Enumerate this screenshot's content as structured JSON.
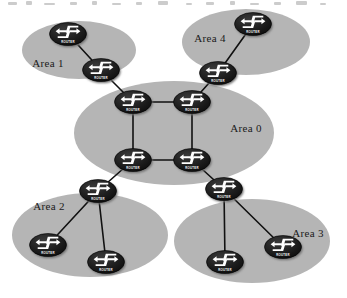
{
  "diagram": {
    "kind": "network-topology-diagram",
    "background_color": "#ffffff",
    "area_fill_color": "#b5b5b5",
    "router_body_color": "#1c1c1c",
    "router_glyph_color": "#ffffff",
    "link_color": "#111111",
    "label_color": "#1a1a1a",
    "router_icon_name": "router-icon",
    "router_caption": "ROUTER",
    "areas": [
      {
        "id": "area-0",
        "label": "Area 0",
        "label_x": 246,
        "label_y": 132,
        "cx": 174,
        "cy": 133,
        "rx": 100,
        "ry": 52
      },
      {
        "id": "area-1",
        "label": "Area 1",
        "label_x": 48,
        "label_y": 67,
        "cx": 79,
        "cy": 50,
        "rx": 57,
        "ry": 29
      },
      {
        "id": "area-2",
        "label": "Area 2",
        "label_x": 49,
        "label_y": 210,
        "cx": 90,
        "cy": 235,
        "rx": 78,
        "ry": 42
      },
      {
        "id": "area-3",
        "label": "Area 3",
        "label_x": 308,
        "label_y": 237,
        "cx": 252,
        "cy": 241,
        "rx": 78,
        "ry": 42
      },
      {
        "id": "area-4",
        "label": "Area 4",
        "label_x": 210,
        "label_y": 42,
        "cx": 246,
        "cy": 42,
        "rx": 64,
        "ry": 33
      }
    ],
    "routers": [
      {
        "id": "r-area1-internal",
        "x": 68,
        "y": 34,
        "area": "Area 1"
      },
      {
        "id": "r-area1-abr",
        "x": 101,
        "y": 70,
        "area": "Area 1"
      },
      {
        "id": "r-area4-internal",
        "x": 253,
        "y": 24,
        "area": "Area 4"
      },
      {
        "id": "r-area4-abr",
        "x": 218,
        "y": 73,
        "area": "Area 4"
      },
      {
        "id": "r-backbone-nw",
        "x": 133,
        "y": 102,
        "area": "Area 0"
      },
      {
        "id": "r-backbone-ne",
        "x": 192,
        "y": 102,
        "area": "Area 0"
      },
      {
        "id": "r-backbone-sw",
        "x": 133,
        "y": 160,
        "area": "Area 0"
      },
      {
        "id": "r-backbone-se",
        "x": 192,
        "y": 160,
        "area": "Area 0"
      },
      {
        "id": "r-area2-abr",
        "x": 98,
        "y": 191,
        "area": "Area 2"
      },
      {
        "id": "r-area2-left",
        "x": 48,
        "y": 245,
        "area": "Area 2"
      },
      {
        "id": "r-area2-right",
        "x": 106,
        "y": 262,
        "area": "Area 2"
      },
      {
        "id": "r-area3-abr",
        "x": 224,
        "y": 189,
        "area": "Area 3"
      },
      {
        "id": "r-area3-left",
        "x": 225,
        "y": 262,
        "area": "Area 3"
      },
      {
        "id": "r-area3-right",
        "x": 283,
        "y": 247,
        "area": "Area 3"
      }
    ],
    "links": [
      {
        "id": "link-a1int-a1abr",
        "from": "r-area1-internal",
        "to": "r-area1-abr"
      },
      {
        "id": "link-a1abr-bbnw",
        "from": "r-area1-abr",
        "to": "r-backbone-nw"
      },
      {
        "id": "link-a4int-a4abr",
        "from": "r-area4-internal",
        "to": "r-area4-abr"
      },
      {
        "id": "link-a4abr-bbne",
        "from": "r-area4-abr",
        "to": "r-backbone-ne"
      },
      {
        "id": "link-bbnw-bbne",
        "from": "r-backbone-nw",
        "to": "r-backbone-ne"
      },
      {
        "id": "link-bbnw-bbsw",
        "from": "r-backbone-nw",
        "to": "r-backbone-sw"
      },
      {
        "id": "link-bbne-bbse",
        "from": "r-backbone-ne",
        "to": "r-backbone-se"
      },
      {
        "id": "link-bbsw-bbse",
        "from": "r-backbone-sw",
        "to": "r-backbone-se"
      },
      {
        "id": "link-bbsw-a2abr",
        "from": "r-backbone-sw",
        "to": "r-area2-abr"
      },
      {
        "id": "link-bbse-a3abr",
        "from": "r-backbone-se",
        "to": "r-area3-abr"
      },
      {
        "id": "link-a2abr-a2l",
        "from": "r-area2-abr",
        "to": "r-area2-left"
      },
      {
        "id": "link-a2abr-a2r",
        "from": "r-area2-abr",
        "to": "r-area2-right"
      },
      {
        "id": "link-a3abr-a3l",
        "from": "r-area3-abr",
        "to": "r-area3-left"
      },
      {
        "id": "link-a3abr-a3r",
        "from": "r-area3-abr",
        "to": "r-area3-right"
      }
    ]
  }
}
